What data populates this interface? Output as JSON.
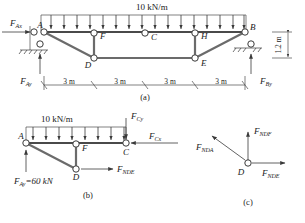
{
  "figure": {
    "subfigures": [
      {
        "key": "a",
        "caption": "(a)"
      },
      {
        "key": "b",
        "caption": "(b)"
      },
      {
        "key": "c",
        "caption": "(c)"
      }
    ]
  },
  "diagram_a": {
    "caption": "(a)",
    "distributed_load": "10 kN/m",
    "joints": [
      "A",
      "F",
      "C",
      "H",
      "B",
      "D",
      "E"
    ],
    "joint_labels": {
      "A": "A",
      "F": "F",
      "C": "C",
      "H": "H",
      "B": "B",
      "D": "D",
      "E": "E"
    },
    "reactions": {
      "ax": "F",
      "ax_sub": "Ax",
      "ay": "F",
      "ay_sub": "Ay",
      "by": "F",
      "by_sub": "By"
    },
    "dimensions": {
      "spans": [
        "3 m",
        "3 m",
        "3 m",
        "3 m"
      ],
      "height": "1.2 m"
    }
  },
  "diagram_b": {
    "caption": "(b)",
    "distributed_load": "10 kN/m",
    "joint_labels": {
      "A": "A",
      "F": "F",
      "C": "C",
      "D": "D"
    },
    "forces": {
      "ay": "F",
      "ay_sub": "Ay",
      "ay_value": "=60 kN",
      "cy": "F",
      "cy_sub": "Cy",
      "cx": "F",
      "cx_sub": "Cx",
      "nde": "F",
      "nde_sub": "NDE"
    }
  },
  "diagram_c": {
    "caption": "(c)",
    "joint_labels": {
      "D": "D"
    },
    "forces": {
      "nda": "F",
      "nda_sub": "NDA",
      "ndf": "F",
      "ndf_sub": "NDF",
      "nde": "F",
      "nde_sub": "NDE"
    }
  },
  "colors": {
    "member": "#6b6b6b",
    "line": "#3a3a3a",
    "text": "#1a1a1a",
    "background": "#ffffff"
  }
}
